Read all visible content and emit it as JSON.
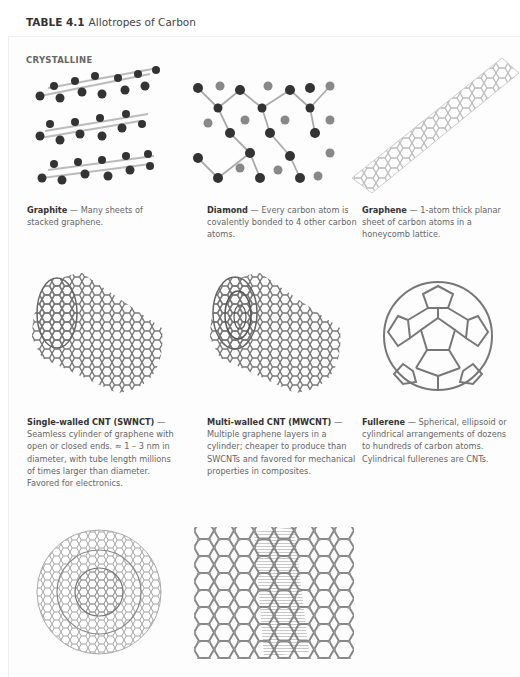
{
  "table": {
    "label": "TABLE 4.1",
    "title": "Allotropes of Carbon"
  },
  "section": {
    "title": "CRYSTALLINE"
  },
  "allotropes": [
    {
      "name": "Graphite",
      "sep": " — ",
      "description": "Many sheets of stacked graphene.",
      "image_icon": "graphite-structure-icon"
    },
    {
      "name": "Diamond",
      "sep": " — ",
      "description": "Every carbon atom is covalently bonded to 4 other carbon atoms.",
      "image_icon": "diamond-structure-icon"
    },
    {
      "name": "Graphene",
      "sep": " — ",
      "description": "1-atom thick planar sheet of carbon atoms in a honeycomb lattice.",
      "image_icon": "graphene-structure-icon"
    },
    {
      "name": "Single-walled CNT (SWNCT)",
      "sep": " — ",
      "description": "Seamless cylinder of graphene with open or closed ends. ≈ 1 – 3 nm in diameter, with tube length millions of times larger than diameter. Favored for electronics.",
      "image_icon": "swcnt-structure-icon"
    },
    {
      "name": "Multi-walled CNT (MWCNT)",
      "sep": " — ",
      "description": "Multiple graphene layers in a cylinder; cheaper to produce than SWCNTs and favored for mechanical properties in composites.",
      "image_icon": "mwcnt-structure-icon"
    },
    {
      "name": "Fullerene",
      "sep": " — ",
      "description": "Spherical, ellipsoid or cylindrical arrangements of dozens to hundreds of carbon atoms. Cylindrical fullerenes are CNTs.",
      "image_icon": "fullerene-structure-icon"
    },
    {
      "name": "",
      "sep": "",
      "description": "",
      "image_icon": "nested-fullerene-structure-icon"
    },
    {
      "name": "",
      "sep": "",
      "description": "",
      "image_icon": "lonsdaleite-structure-icon"
    }
  ]
}
